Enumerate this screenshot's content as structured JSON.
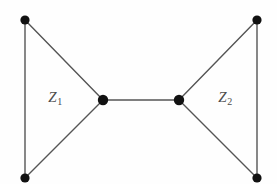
{
  "figure": {
    "background_color": "#fefefe",
    "edge_color": "#555555",
    "vertex_color": "#111111",
    "label_color": "#4d4d4d",
    "width": 277,
    "height": 184
  },
  "labels": {
    "left_region": {
      "base": "Z",
      "subscript": "1",
      "x": 55,
      "y": 97
    },
    "right_region": {
      "base": "Z",
      "subscript": "2",
      "x": 225,
      "y": 97
    }
  },
  "chart_data": {
    "type": "diagram",
    "title": "",
    "vertices": [
      {
        "id": "top-left",
        "x": 25,
        "y": 20,
        "r": 4.6
      },
      {
        "id": "bottom-left",
        "x": 25,
        "y": 178,
        "r": 4.6
      },
      {
        "id": "left-center",
        "x": 103,
        "y": 100,
        "r": 5.2
      },
      {
        "id": "right-center",
        "x": 179,
        "y": 100,
        "r": 5.2
      },
      {
        "id": "top-right",
        "x": 257,
        "y": 20,
        "r": 4.6
      },
      {
        "id": "bottom-right",
        "x": 257,
        "y": 178,
        "r": 4.6
      }
    ],
    "edges": [
      {
        "id": "left-vertical",
        "from": "top-left",
        "to": "bottom-left"
      },
      {
        "id": "left-upper-diagonal",
        "from": "top-left",
        "to": "left-center"
      },
      {
        "id": "left-lower-diagonal",
        "from": "bottom-left",
        "to": "left-center"
      },
      {
        "id": "bridge",
        "from": "left-center",
        "to": "right-center"
      },
      {
        "id": "right-upper-diagonal",
        "from": "top-right",
        "to": "right-center"
      },
      {
        "id": "right-lower-diagonal",
        "from": "bottom-right",
        "to": "right-center"
      },
      {
        "id": "right-vertical",
        "from": "top-right",
        "to": "bottom-right"
      }
    ],
    "annotations": [
      "Z1",
      "Z2"
    ]
  }
}
